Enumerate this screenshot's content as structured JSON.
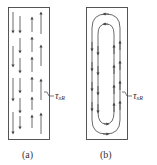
{
  "figure": {
    "panels": [
      {
        "id": "a",
        "caption": "(a)",
        "description": "Unidirectional arrows: left columns point down, right columns point up",
        "annotation": {
          "symbol": "τ",
          "subscript": "xR",
          "text": "τxR"
        }
      },
      {
        "id": "b",
        "caption": "(b)",
        "description": "Recirculating flow: nested U-shaped loops, down on left, up on right",
        "annotation": {
          "symbol": "τ",
          "subscript": "xR",
          "text": "τxR"
        }
      }
    ],
    "colors": {
      "stroke": "#444444",
      "background": "#ffffff"
    }
  }
}
